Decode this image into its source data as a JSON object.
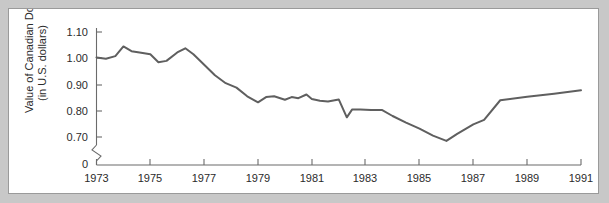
{
  "chart_data": {
    "type": "line",
    "title": "",
    "xlabel": "",
    "ylabel": "Value of Canadian Dollar (in U.S. dollars)",
    "ylabel_line1": "Value of Canadian Dollar",
    "ylabel_line2": "(in U.S. dollars)",
    "xlim": [
      1973,
      1991
    ],
    "ylim": [
      0.7,
      1.1
    ],
    "y_axis_break": true,
    "y_axis_break_between": [
      0,
      0.7
    ],
    "grid": false,
    "legend": "none",
    "line_color": "#5f5f5f",
    "xticks": [
      1973,
      1975,
      1977,
      1979,
      1981,
      1983,
      1985,
      1987,
      1989,
      1991
    ],
    "xtick_labels": [
      "1973",
      "1975",
      "1977",
      "1979",
      "1981",
      "1983",
      "1985",
      "1987",
      "1989",
      "1991"
    ],
    "yticks": [
      0,
      0.7,
      0.8,
      0.9,
      1.0,
      1.1
    ],
    "ytick_labels": [
      "0",
      "0.70",
      "0.80",
      "0.90",
      "1.00",
      "1.10"
    ],
    "series": [
      {
        "name": "Value of Canadian Dollar",
        "x": [
          1973.0,
          1973.35,
          1973.7,
          1974.0,
          1974.3,
          1974.6,
          1975.0,
          1975.3,
          1975.6,
          1976.0,
          1976.3,
          1976.6,
          1977.0,
          1977.4,
          1977.8,
          1978.2,
          1978.6,
          1979.0,
          1979.3,
          1979.6,
          1980.0,
          1980.25,
          1980.5,
          1980.8,
          1981.0,
          1981.3,
          1981.6,
          1982.0,
          1982.3,
          1982.5,
          1982.8,
          1983.2,
          1983.6,
          1984.0,
          1984.5,
          1985.0,
          1985.5,
          1986.0,
          1986.4,
          1987.0,
          1987.4,
          1988.0,
          1989.0,
          1990.0,
          1991.0
        ],
        "y": [
          1.003,
          0.998,
          1.008,
          1.045,
          1.027,
          1.022,
          1.015,
          0.985,
          0.99,
          1.022,
          1.038,
          1.015,
          0.975,
          0.935,
          0.905,
          0.888,
          0.855,
          0.832,
          0.852,
          0.855,
          0.842,
          0.852,
          0.848,
          0.862,
          0.845,
          0.838,
          0.835,
          0.843,
          0.775,
          0.805,
          0.805,
          0.803,
          0.803,
          0.78,
          0.755,
          0.732,
          0.705,
          0.685,
          0.712,
          0.748,
          0.765,
          0.84,
          0.853,
          0.865,
          0.878
        ]
      }
    ]
  },
  "figure": {
    "panel_background": "#ffffff",
    "outer_background": "#c8c8c8",
    "border_color": "#9a9a9a"
  }
}
